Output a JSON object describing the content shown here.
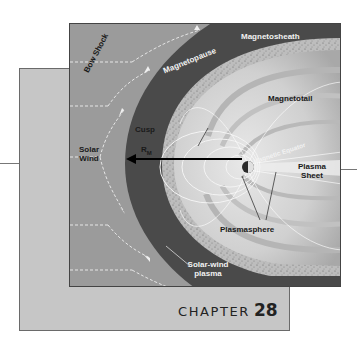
{
  "figure": {
    "labels": {
      "magnetosheath": "Magnetosheath",
      "bow_shock": "Bow Shock",
      "magnetopause": "Magnetopause",
      "magnetotail": "Magnetotail",
      "cusp": "Cusp",
      "solar_wind_line1": "Solar",
      "solar_wind_line2": "Wind",
      "rm_main": "R",
      "rm_sub": "M",
      "magnetic_equator": "Magnetic Equator",
      "plasma_sheet_line1": "Plasma",
      "plasma_sheet_line2": "Sheet",
      "plasmasphere": "Plasmasphere",
      "solar_wind_plasma_line1": "Solar-wind",
      "solar_wind_plasma_line2": "plasma"
    },
    "colors": {
      "solar_wind_region": "#9b9b9b",
      "magnetosheath": "#4a4a4a",
      "magnetosphere": "#d8d8d8",
      "outline": "#444444"
    }
  },
  "chapter": {
    "word": "CHAPTER",
    "number": "28"
  }
}
